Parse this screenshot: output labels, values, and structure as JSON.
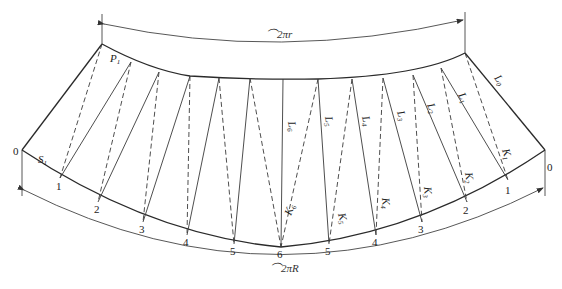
{
  "diagram": {
    "title_partial": "",
    "top_arc_label": "⌒2πr",
    "bottom_arc_label": "⌒2πR",
    "corner_labels": {
      "left_top": "P1",
      "left_segment": "S1"
    },
    "left_point_labels": [
      "0",
      "1",
      "2",
      "3",
      "4",
      "5",
      "6"
    ],
    "right_point_labels": [
      "5",
      "4",
      "3",
      "2",
      "1",
      "0"
    ],
    "solid_line_labels": [
      "L0",
      "L1",
      "L2",
      "L3",
      "L4",
      "L5",
      "L6"
    ],
    "dashed_line_labels": [
      "K1",
      "K2",
      "K3",
      "K4",
      "K5",
      "K6"
    ]
  }
}
